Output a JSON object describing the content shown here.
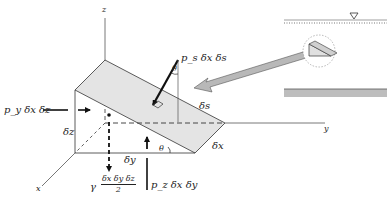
{
  "figure": {
    "axes": {
      "x": "x",
      "y": "y",
      "z": "z"
    },
    "forces": {
      "inclined": "p_s δx δs",
      "horizontal": "p_y δx δz",
      "vertical": "p_z δx δy",
      "weight_prefix": "γ",
      "weight_numerator": "δx δy δz",
      "weight_denominator": "2"
    },
    "dimensions": {
      "ds": "δs",
      "dx": "δx",
      "dy": "δy",
      "dz": "δz",
      "theta_top": "θ",
      "theta_bottom": "θ"
    },
    "inset": {
      "free_surface_symbol": "▽",
      "description": "Fluid body with free surface, magnified circle showing wedge element, bottom boundary"
    },
    "colors": {
      "wedge_fill": "#e4e4e4",
      "arrow_fill": "#b8b8b8",
      "line": "#333333",
      "bottom_bar": "#bdbdbd"
    }
  }
}
